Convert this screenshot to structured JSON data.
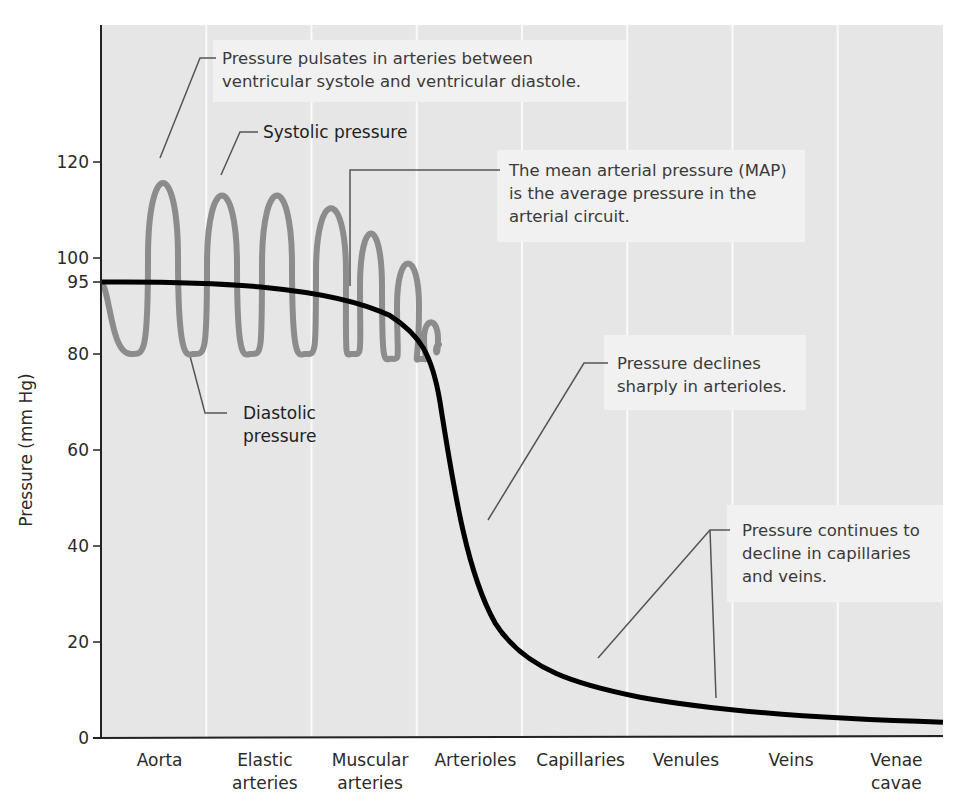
{
  "chart_data": {
    "type": "line",
    "title": "",
    "xlabel": "",
    "ylabel": "Pressure (mm Hg)",
    "ylim": [
      0,
      135
    ],
    "yticks": [
      0,
      20,
      40,
      60,
      80,
      95,
      100,
      120
    ],
    "grid": "vertical column separators between vessel types",
    "categories": [
      [
        "Aorta"
      ],
      [
        "Elastic",
        "arteries"
      ],
      [
        "Muscular",
        "arteries"
      ],
      [
        "Arterioles"
      ],
      [
        "Capillaries"
      ],
      [
        "Venules"
      ],
      [
        "Veins"
      ],
      [
        "Venae",
        "cavae"
      ]
    ],
    "series": [
      {
        "name": "Pulsatile arterial pressure",
        "color": "#8c8c8c",
        "peaks": [
          {
            "segment": "Aorta",
            "systolic": 120,
            "diastolic": 80
          },
          {
            "segment": "Elastic arteries",
            "systolic": 117,
            "diastolic": 80
          },
          {
            "segment": "Elastic arteries",
            "systolic": 117,
            "diastolic": 80
          },
          {
            "segment": "Muscular arteries",
            "systolic": 114,
            "diastolic": 80
          },
          {
            "segment": "Muscular arteries",
            "systolic": 108,
            "diastolic": 80
          },
          {
            "segment": "Muscular arteries",
            "systolic": 101,
            "diastolic": 79
          },
          {
            "segment": "Arterioles (start)",
            "systolic": 87,
            "diastolic": 79
          }
        ]
      },
      {
        "name": "Mean arterial pressure (MAP)",
        "color": "#000000",
        "x": [
          "Aorta",
          "Elastic arteries",
          "Muscular arteries",
          "Arterioles (start)",
          "Arterioles (mid)",
          "Capillaries",
          "Venules",
          "Veins",
          "Venae cavae"
        ],
        "values": [
          95,
          95,
          93,
          82,
          45,
          18,
          9,
          5,
          3
        ]
      }
    ],
    "annotations": [
      {
        "id": "pulsates",
        "lines": [
          "Pressure pulsates in arteries between",
          "ventricular systole and ventricular diastole."
        ]
      },
      {
        "id": "systolic",
        "lines": [
          "Systolic pressure"
        ]
      },
      {
        "id": "map",
        "lines": [
          "The mean arterial pressure (MAP)",
          "is the average pressure in the",
          "arterial circuit."
        ]
      },
      {
        "id": "diastolic",
        "lines": [
          "Diastolic",
          "pressure"
        ]
      },
      {
        "id": "arterioles",
        "lines": [
          "Pressure declines",
          "sharply in arterioles."
        ]
      },
      {
        "id": "capillaries",
        "lines": [
          "Pressure continues to",
          "decline in capillaries",
          "and veins."
        ]
      }
    ],
    "legend": "none (callout annotations)"
  },
  "colors": {
    "plot_bg": "#e6e6e6",
    "note_box": "#f1f1f1",
    "divider": "#fafafa",
    "axis": "#222222",
    "pulse_line": "#8c8c8c",
    "map_line": "#000000",
    "leader_line": "#555555"
  }
}
